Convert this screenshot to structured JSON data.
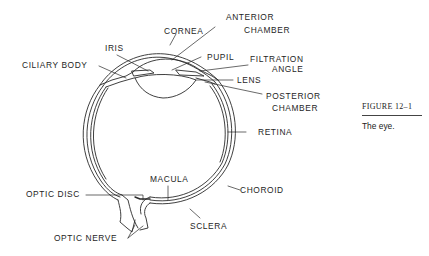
{
  "figure": {
    "number": "FIGURE 12–1",
    "caption": "The eye."
  },
  "labels": {
    "cornea": "CORNEA",
    "anterior_chamber_1": "ANTERIOR",
    "anterior_chamber_2": "CHAMBER",
    "iris": "IRIS",
    "pupil": "PUPIL",
    "filtration_angle_1": "FILTRATION",
    "filtration_angle_2": "ANGLE",
    "ciliary_body": "CILIARY BODY",
    "lens": "LENS",
    "posterior_chamber_1": "POSTERIOR",
    "posterior_chamber_2": "CHAMBER",
    "retina": "RETINA",
    "macula": "MACULA",
    "optic_disc": "OPTIC DISC",
    "choroid": "CHOROID",
    "sclera": "SCLERA",
    "optic_nerve": "OPTIC NERVE"
  },
  "colors": {
    "line": "#2a2a2a",
    "background": "#ffffff"
  }
}
